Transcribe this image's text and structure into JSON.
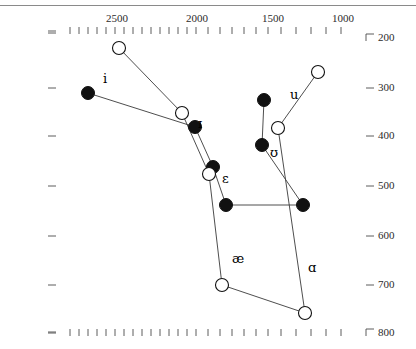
{
  "chart_data": {
    "type": "scatter",
    "title": "",
    "xlabel": "",
    "ylabel": "",
    "xaxis": {
      "position": "top",
      "scale": "log-reversed",
      "tick_labels": [
        "2500",
        "2000",
        "1500",
        "1000"
      ],
      "tick_label_px": [
        119,
        199,
        275,
        345
      ],
      "minor_ticks_px": [
        70,
        79,
        88,
        97,
        106,
        115,
        124,
        133,
        142,
        151,
        160,
        169,
        178,
        187,
        196,
        208,
        220,
        232,
        244,
        256,
        268,
        281,
        296,
        311,
        326,
        341
      ],
      "corner_glyph": "⌐",
      "left_dash": "–"
    },
    "yaxis": {
      "position": "right",
      "tick_labels": [
        "200",
        "300",
        "400",
        "500",
        "600",
        "700",
        "800"
      ],
      "tick_label_px": [
        38,
        88,
        136,
        186,
        236,
        285,
        333
      ],
      "left_ticks_px": [
        33,
        88,
        136,
        186,
        236,
        285,
        333
      ],
      "top_corner_glyph": "⌐",
      "bottom_corner_glyph": "⌐"
    },
    "bottom_axis": {
      "minor_ticks_px": [
        70,
        79,
        88,
        97,
        106,
        115,
        124,
        133,
        142,
        151,
        160,
        169,
        178,
        187,
        196,
        208,
        220,
        232,
        244,
        256,
        268,
        281,
        296,
        311,
        326,
        341
      ],
      "left_dash": "–"
    },
    "series": [
      {
        "name": "filled",
        "marker": "filled-circle",
        "color": "#111111",
        "points": [
          {
            "label": "i",
            "x_px": 88,
            "y_px": 93
          },
          {
            "label": "ɪ",
            "x_px": 195,
            "y_px": 127
          },
          {
            "label": "ɛ",
            "x_px": 213,
            "y_px": 167
          },
          {
            "label": "æ",
            "x_px": 226,
            "y_px": 205
          },
          {
            "label": "ɑ",
            "x_px": 303,
            "y_px": 205
          },
          {
            "label": "ʊ",
            "x_px": 262,
            "y_px": 145
          },
          {
            "label": "u",
            "x_px": 264,
            "y_px": 100
          }
        ],
        "path_order": [
          "i",
          "ɪ",
          "ɛ",
          "æ",
          "ɑ",
          "ʊ",
          "u"
        ]
      },
      {
        "name": "open",
        "marker": "open-circle",
        "color": "#111111",
        "points": [
          {
            "label": "i",
            "x_px": 119,
            "y_px": 48
          },
          {
            "label": "ɪ",
            "x_px": 182,
            "y_px": 113
          },
          {
            "label": "ɛ",
            "x_px": 209,
            "y_px": 174
          },
          {
            "label": "æ",
            "x_px": 222,
            "y_px": 285
          },
          {
            "label": "ɑ",
            "x_px": 305,
            "y_px": 313
          },
          {
            "label": "ʊ",
            "x_px": 278,
            "y_px": 128
          },
          {
            "label": "u",
            "x_px": 318,
            "y_px": 72
          }
        ],
        "path_order": [
          "i",
          "ɪ",
          "ɛ",
          "æ",
          "ɑ",
          "ʊ",
          "u"
        ]
      }
    ],
    "vowel_labels": [
      {
        "text": "i",
        "x_px": 103,
        "y_px": 71
      },
      {
        "text": "ɪ",
        "x_px": 198,
        "y_px": 116
      },
      {
        "text": "ɛ",
        "x_px": 222,
        "y_px": 171
      },
      {
        "text": "æ",
        "x_px": 232,
        "y_px": 251
      },
      {
        "text": "ɑ",
        "x_px": 308,
        "y_px": 260
      },
      {
        "text": "ʊ",
        "x_px": 270,
        "y_px": 145
      },
      {
        "text": "u",
        "x_px": 290,
        "y_px": 87
      }
    ]
  }
}
